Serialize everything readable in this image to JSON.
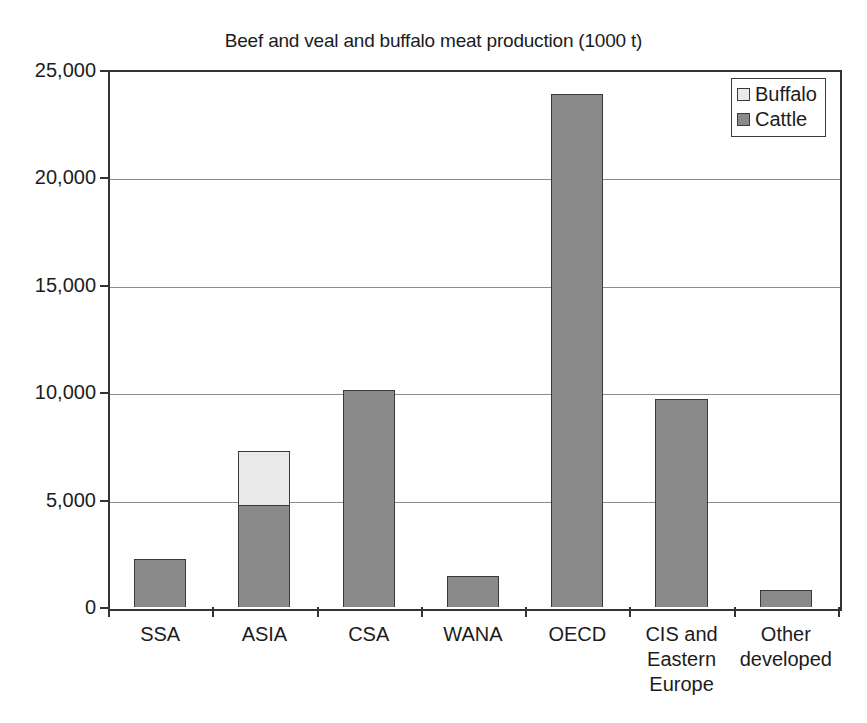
{
  "chart_data": {
    "type": "bar",
    "stacked": true,
    "title": "Beef and veal and buffalo meat production (1000 t)",
    "xlabel": "",
    "ylabel": "",
    "ylim": [
      0,
      25000
    ],
    "ytick_values": [
      25000,
      20000,
      15000,
      10000,
      5000,
      0
    ],
    "ytick_labels": [
      "25,000",
      "20,000",
      "15,000",
      "10,000",
      "5,000",
      "0"
    ],
    "grid": true,
    "grid_axis": "y",
    "legend_position": "top-right",
    "categories": [
      "SSA",
      "ASIA",
      "CSA",
      "WANA",
      "OECD",
      "CIS and Eastern Europe",
      "Other developed"
    ],
    "category_label_lines": [
      [
        "SSA"
      ],
      [
        "ASIA"
      ],
      [
        "CSA"
      ],
      [
        "WANA"
      ],
      [
        "OECD"
      ],
      [
        "CIS and",
        "Eastern",
        "Europe"
      ],
      [
        "Other",
        "developed"
      ]
    ],
    "series": [
      {
        "name": "Cattle",
        "color": "#8a8a8a",
        "values": [
          2250,
          4750,
          10100,
          1450,
          23900,
          9700,
          780
        ]
      },
      {
        "name": "Buffalo",
        "color": "#e9e9e9",
        "values": [
          0,
          2500,
          0,
          0,
          0,
          0,
          0
        ]
      }
    ],
    "stack_order": [
      "Cattle",
      "Buffalo"
    ],
    "totals": [
      2250,
      7250,
      10100,
      1450,
      23900,
      9700,
      780
    ]
  },
  "legend": {
    "items": [
      {
        "label": "Buffalo",
        "color": "#e9e9e9"
      },
      {
        "label": "Cattle",
        "color": "#8a8a8a"
      }
    ]
  },
  "colors": {
    "cattle": "#8a8a8a",
    "buffalo": "#e9e9e9",
    "axis": "#333333",
    "gridline": "#8d8d8d",
    "text": "#1c1c1c",
    "background": "#ffffff"
  }
}
